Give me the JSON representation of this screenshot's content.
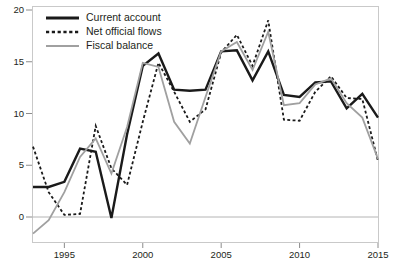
{
  "chart_data": {
    "type": "line",
    "title": "",
    "xlabel": "",
    "ylabel": "",
    "xlim": [
      1993,
      2015
    ],
    "ylim": [
      -2.5,
      20.8
    ],
    "grid": false,
    "zero_line": true,
    "legend_position": "top-left",
    "x": [
      1993,
      1994,
      1995,
      1996,
      1997,
      1998,
      1999,
      2000,
      2001,
      2002,
      2003,
      2004,
      2005,
      2006,
      2007,
      2008,
      2009,
      2010,
      2011,
      2012,
      2013,
      2014,
      2015
    ],
    "xticks": [
      1995,
      2000,
      2005,
      2010,
      2015
    ],
    "xtick_labels": [
      "1995",
      "2000",
      "2005",
      "2010",
      "2015"
    ],
    "yticks": [
      0,
      5,
      10,
      15,
      20
    ],
    "ytick_labels": [
      "0",
      "5",
      "10",
      "15",
      "20"
    ],
    "series": [
      {
        "name": "Current account",
        "style": "solid",
        "color": "#1a1a1a",
        "width": 2.4,
        "values": [
          2.9,
          2.9,
          3.4,
          6.6,
          6.3,
          -0.1,
          8.0,
          14.6,
          15.8,
          12.3,
          12.2,
          12.3,
          16.0,
          16.1,
          13.2,
          16.0,
          11.8,
          11.6,
          13.0,
          13.1,
          10.5,
          11.9,
          9.6
        ]
      },
      {
        "name": "Net official flows",
        "style": "dotted",
        "color": "#1a1a1a",
        "width": 1.8,
        "values": [
          6.8,
          2.4,
          0.2,
          0.3,
          8.8,
          4.7,
          3.1,
          9.2,
          14.9,
          12.1,
          9.2,
          10.4,
          15.9,
          17.6,
          14.6,
          19.0,
          9.4,
          9.3,
          12.1,
          13.6,
          11.5,
          11.4,
          5.4
        ]
      },
      {
        "name": "Fiscal balance",
        "style": "solid",
        "color": "#a0a0a0",
        "width": 1.8,
        "values": [
          -1.6,
          -0.3,
          2.4,
          5.8,
          7.6,
          4.2,
          8.7,
          14.9,
          14.5,
          9.2,
          7.1,
          11.6,
          16.0,
          16.9,
          14.2,
          17.9,
          10.8,
          11.0,
          12.8,
          13.4,
          11.0,
          9.6,
          5.6
        ]
      }
    ]
  },
  "legend": {
    "items": [
      {
        "label": "Current account"
      },
      {
        "label": "Net official flows"
      },
      {
        "label": "Fiscal balance"
      }
    ]
  }
}
